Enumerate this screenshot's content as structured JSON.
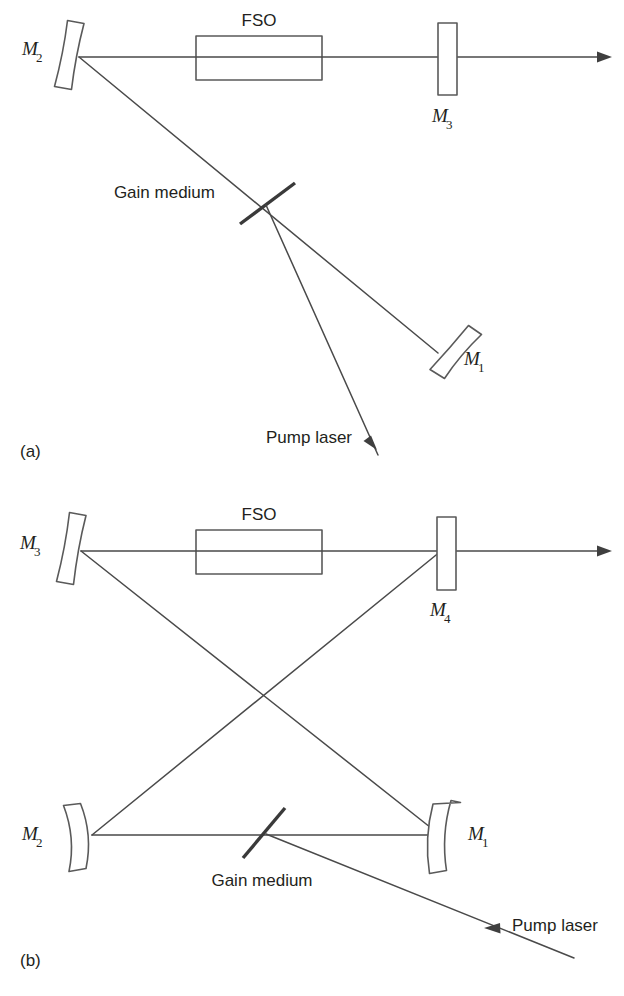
{
  "figure": {
    "background_color": "#ffffff",
    "line_color": "#4a4a4a",
    "text_color": "#231f20",
    "gain_color": "#3a3a3a"
  },
  "panels": [
    {
      "id": "a",
      "caption": "(a)",
      "description": "Three-mirror folded laser cavity with FSO section",
      "components": {
        "fso_label": "FSO",
        "gain_label": "Gain medium",
        "pump_label": "Pump laser",
        "mirrors": [
          {
            "base": "M",
            "sub": "2",
            "full": "M2",
            "kind": "concave-curved",
            "position": "left"
          },
          {
            "base": "M",
            "sub": "3",
            "full": "M3",
            "kind": "flat-output-coupler",
            "position": "right"
          },
          {
            "base": "M",
            "sub": "1",
            "full": "M1",
            "kind": "concave-curved",
            "position": "lower-right"
          }
        ]
      }
    },
    {
      "id": "b",
      "caption": "(b)",
      "description": "Four-mirror bow-tie ring laser cavity with FSO section",
      "components": {
        "fso_label": "FSO",
        "gain_label": "Gain medium",
        "pump_label": "Pump laser",
        "mirrors": [
          {
            "base": "M",
            "sub": "3",
            "full": "M3",
            "kind": "concave-curved",
            "position": "upper-left"
          },
          {
            "base": "M",
            "sub": "4",
            "full": "M4",
            "kind": "flat-output-coupler",
            "position": "upper-right"
          },
          {
            "base": "M",
            "sub": "2",
            "full": "M2",
            "kind": "concave-curved",
            "position": "lower-left"
          },
          {
            "base": "M",
            "sub": "1",
            "full": "M1",
            "kind": "concave-curved",
            "position": "lower-right"
          }
        ]
      }
    }
  ]
}
